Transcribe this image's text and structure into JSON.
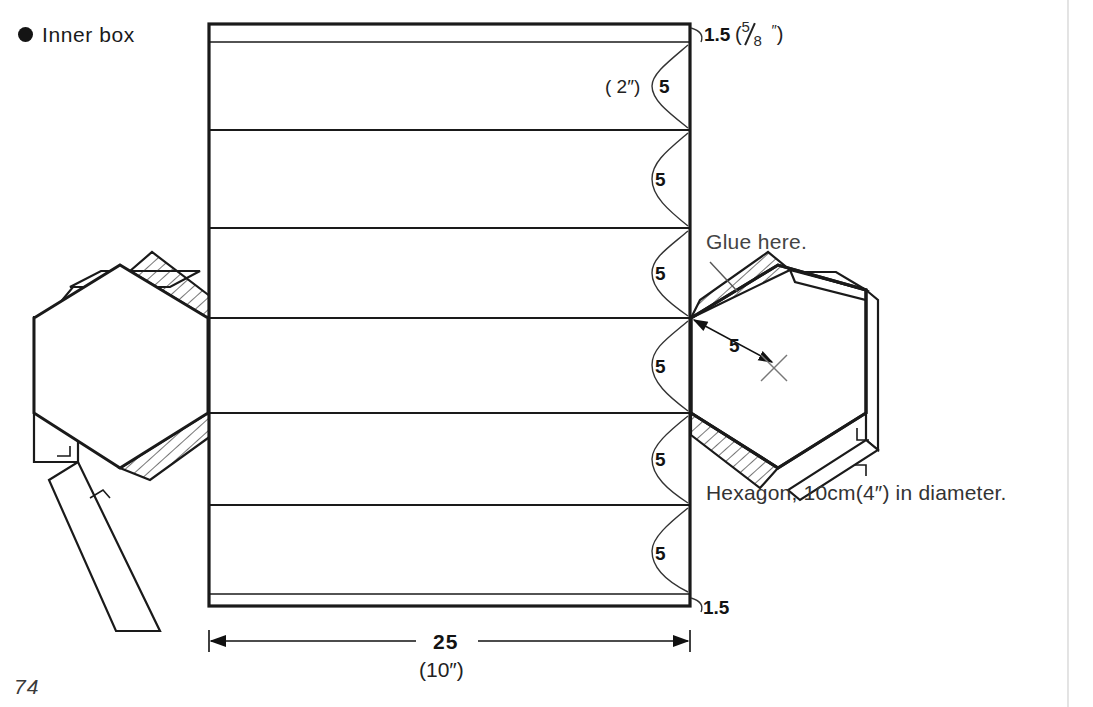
{
  "page": {
    "number": "74",
    "background": "#ffffff",
    "ink": "#1a1a1a"
  },
  "header": {
    "bullet_icon": "filled-circle",
    "title": "Inner box"
  },
  "diagram": {
    "type": "papercraft-unfolded-net",
    "body_panel": {
      "left_x": 209,
      "right_x": 690,
      "top_y": 24,
      "bottom_y": 606,
      "fold_lines_y": [
        42,
        130,
        228,
        318,
        413,
        505,
        594
      ]
    },
    "labels": {
      "top_flap": {
        "value": "1.5",
        "alt_value_open": "(",
        "fraction_numerator": "5",
        "fraction_denominator": "8",
        "inch_mark": "″",
        "alt_value_close": ")",
        "display": "1.5 ( 5/8″ )"
      },
      "first_panel": {
        "alt_value": "( 2″)",
        "value": "5"
      },
      "panel_values": [
        "5",
        "5",
        "5",
        "5",
        "5"
      ],
      "bottom_flap": {
        "value": "1.5"
      },
      "glue_note": "Glue here.",
      "hexagon_edge": {
        "value": "5"
      },
      "hexagon_caption": "Hexagon, 10cm(4″) in diameter.",
      "overall_width": {
        "value": "25",
        "alt_value": "(10″)"
      }
    },
    "hexagons": [
      {
        "side": "left",
        "center_x": 112,
        "center_y": 365,
        "radius": 78
      },
      {
        "side": "right",
        "center_x": 787,
        "center_y": 365,
        "radius": 78
      }
    ],
    "colors": {
      "line": "#1a1a1a",
      "thin_line": "#333333",
      "hatch": "#2a2a2a",
      "text": "#2b2b2b",
      "label_gray": "#444444"
    }
  }
}
